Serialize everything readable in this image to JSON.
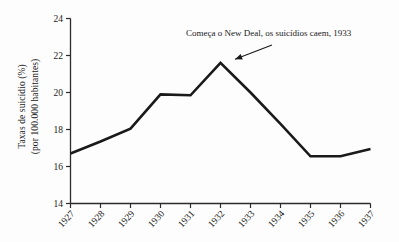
{
  "chart_data": {
    "type": "line",
    "title": "",
    "subtitle": "",
    "xlabel": "",
    "ylabel_line1": "Taxas de suicídio (%)",
    "ylabel_line2": "(por 100.000 habitantes)",
    "categories": [
      "1927",
      "1928",
      "1929",
      "1930",
      "1931",
      "1932",
      "1933",
      "1934",
      "1935",
      "1936",
      "1937"
    ],
    "values": [
      16.7,
      17.35,
      18.05,
      19.9,
      19.85,
      21.6,
      20.0,
      18.3,
      16.55,
      16.55,
      16.95
    ],
    "ylim": [
      14,
      24
    ],
    "ytick_labels": [
      "14",
      "16",
      "18",
      "20",
      "22",
      "24"
    ],
    "ytick_values": [
      14,
      16,
      18,
      20,
      22,
      24
    ],
    "grid": false,
    "legend": "none",
    "series": [
      {
        "name": "Taxas de suicídio",
        "values": [
          16.7,
          17.35,
          18.05,
          19.9,
          19.85,
          21.6,
          20.0,
          18.3,
          16.55,
          16.55,
          16.95
        ]
      }
    ],
    "annotations": [
      {
        "text": "Começa o New Deal, os suicídios caem, 1933",
        "points_to_category": "1932",
        "points_to_value": 21.6
      }
    ],
    "line_color": "#1a1a1a",
    "background_color": "#fdfdfd",
    "axis_color": "#2b2b2b"
  }
}
